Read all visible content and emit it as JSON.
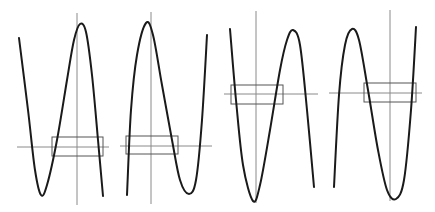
{
  "figure": {
    "colors": {
      "curve": "#1a1a1a",
      "axis": "#8a8a8a",
      "window": "#555555",
      "background": "#ffffff"
    },
    "panels": [
      {
        "id": "panel-1",
        "shape": "positive cubic shifted (rises to left minimum then maximum near y-axis)",
        "y_axis": {
          "x": 77,
          "y1": 13,
          "y2": 205
        },
        "x_axis": {
          "y": 147,
          "x1": 17,
          "x2": 109
        },
        "window": {
          "x": 52,
          "y": 137,
          "w": 51,
          "h": 19
        },
        "curve_points": [
          [
            19,
            38
          ],
          [
            28,
            110
          ],
          [
            35,
            170
          ],
          [
            41,
            195
          ],
          [
            47,
            185
          ],
          [
            57,
            140
          ],
          [
            67,
            80
          ],
          [
            74,
            40
          ],
          [
            80,
            24
          ],
          [
            86,
            32
          ],
          [
            92,
            75
          ],
          [
            98,
            140
          ],
          [
            103,
            196
          ]
        ]
      },
      {
        "id": "panel-2",
        "shape": "cubic with maximum left of y-axis and minimum to the right",
        "y_axis": {
          "x": 151,
          "y1": 12,
          "y2": 204
        },
        "x_axis": {
          "y": 146,
          "x1": 120,
          "x2": 212
        },
        "window": {
          "x": 126,
          "y": 136,
          "w": 52,
          "h": 18
        },
        "curve_points": [
          [
            127,
            195
          ],
          [
            131,
            110
          ],
          [
            137,
            55
          ],
          [
            146,
            23
          ],
          [
            153,
            35
          ],
          [
            162,
            85
          ],
          [
            172,
            140
          ],
          [
            180,
            180
          ],
          [
            189,
            194
          ],
          [
            196,
            180
          ],
          [
            202,
            120
          ],
          [
            207,
            35
          ]
        ]
      },
      {
        "id": "panel-3",
        "shape": "cubic with minimum near y-axis and maximum to the right",
        "y_axis": {
          "x": 256,
          "y1": 11,
          "y2": 203
        },
        "x_axis": {
          "y": 94,
          "x1": 224,
          "x2": 318
        },
        "window": {
          "x": 231,
          "y": 85,
          "w": 52,
          "h": 19
        },
        "curve_points": [
          [
            230,
            29
          ],
          [
            236,
            100
          ],
          [
            243,
            165
          ],
          [
            253,
            201
          ],
          [
            260,
            185
          ],
          [
            270,
            130
          ],
          [
            280,
            70
          ],
          [
            287,
            40
          ],
          [
            293,
            30
          ],
          [
            300,
            45
          ],
          [
            307,
            110
          ],
          [
            314,
            187
          ]
        ]
      },
      {
        "id": "panel-4",
        "shape": "cubic with maximum on left and minimum near y-axis",
        "y_axis": {
          "x": 390,
          "y1": 10,
          "y2": 201
        },
        "x_axis": {
          "y": 93,
          "x1": 329,
          "x2": 422
        },
        "window": {
          "x": 364,
          "y": 83,
          "w": 52,
          "h": 19
        },
        "curve_points": [
          [
            334,
            187
          ],
          [
            339,
            95
          ],
          [
            345,
            45
          ],
          [
            352,
            29
          ],
          [
            359,
            40
          ],
          [
            368,
            90
          ],
          [
            378,
            150
          ],
          [
            387,
            190
          ],
          [
            396,
            199
          ],
          [
            404,
            180
          ],
          [
            411,
            110
          ],
          [
            416,
            27
          ]
        ]
      }
    ]
  }
}
